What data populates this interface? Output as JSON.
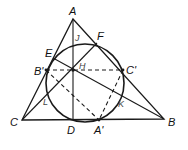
{
  "diagram": {
    "stroke_color": "#1a1a1a",
    "labels": {
      "A": "A",
      "B": "B",
      "C": "C",
      "D": "D",
      "E": "E",
      "F": "F",
      "H": "H",
      "J": "J",
      "K": "K",
      "L": "L",
      "A_prime": "A'",
      "B_prime": "B'",
      "C_prime": "C'"
    }
  }
}
